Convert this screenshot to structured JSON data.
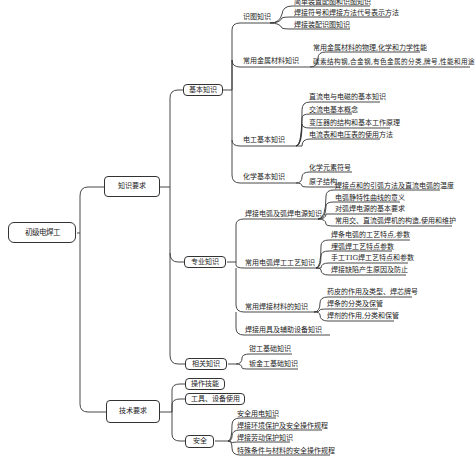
{
  "root": {
    "label": "初级电焊工"
  },
  "branches": [
    {
      "label": "知识要求",
      "children": [
        {
          "label": "基本知识",
          "children": [
            {
              "label": "识图知识",
              "items": [
                "简单装置配图和识图知识",
                "焊接符号和焊接方法代号表示方法",
                "焊接装配识图知识"
              ]
            },
            {
              "label": "常用金属材料知识",
              "items": [
                "常用金属材料的物理,化学和力学性能",
                "碳素结构钢,合金钢,有色金属的分类,牌号,性能和用途"
              ]
            },
            {
              "label": "电工基本知识",
              "items": [
                "直流电与电磁的基本知识",
                "交流电基本概念",
                "变压器的结构和基本工作原理",
                "电流表和电压表的使用方法"
              ]
            },
            {
              "label": "化学基本知识",
              "items": [
                "化学元素符号",
                "原子结构"
              ]
            }
          ]
        },
        {
          "label": "专业知识",
          "children": [
            {
              "label": "焊接电弧及弧焊电源知识",
              "items": [
                "焊接点和的引弧方法及直流电弧的温度",
                "电弧静特性曲线的意义",
                "对弧焊电源的基本要求",
                "常用交、直流弧焊机的构造,使用和维护"
              ]
            },
            {
              "label": "常用电弧焊工工艺知识",
              "items": [
                "焊条电弧的工艺特点,参数",
                "埋弧焊工艺特点参数",
                "手工TIG焊工艺特点和参数",
                "焊接缺陷产生原因及防止"
              ]
            },
            {
              "label": "常用焊接材料的知识",
              "items": [
                "药皮的作用及类型、焊芯牌号",
                "焊条的分类及保管",
                "焊剂的作用,分类和保管"
              ]
            },
            {
              "label": "焊接用具及辅助设备知识",
              "items": []
            }
          ]
        },
        {
          "label": "相关知识",
          "items": [
            "钳工基础知识",
            "钣金工基础知识"
          ]
        }
      ]
    },
    {
      "label": "技术要求",
      "children": [
        {
          "label": "操作技能"
        },
        {
          "label": "工具、设备使用"
        },
        {
          "label": "安全",
          "items": [
            "安全用电知识",
            "焊接环境保护及安全操作规程",
            "焊接劳动保护知识",
            "特殊条件与材料的安全操作规程"
          ]
        }
      ]
    }
  ]
}
